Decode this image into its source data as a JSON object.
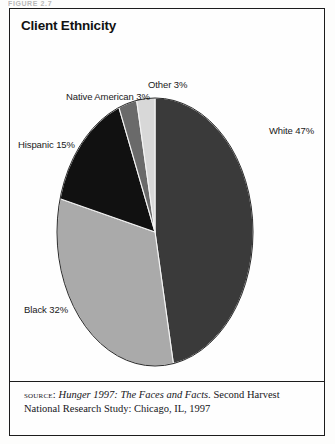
{
  "figure": {
    "cut_caption": "FIGURE 2.7",
    "title": "Client Ethnicity"
  },
  "source": {
    "label": "source:",
    "title": "Hunger 1997: The Faces and Facts.",
    "rest": "Second Harvest National Research Study: Chicago, IL, 1997"
  },
  "chart_data": {
    "type": "pie",
    "title": "Client Ethnicity",
    "unit": "%",
    "total": 100,
    "start_angle_deg": 0,
    "direction": "clockwise",
    "legend": "none-external-labels",
    "grid": false,
    "categories": [
      "White",
      "Black",
      "Hispanic",
      "Native American",
      "Other"
    ],
    "values": [
      47,
      32,
      15,
      3,
      3
    ],
    "colors": [
      "#3a3a3a",
      "#aaaaaa",
      "#111111",
      "#6a6a6a",
      "#d8d8d8"
    ],
    "labels": [
      "White 47%",
      "Black 32%",
      "Hispanic 15%",
      "Native American 3%",
      "Other 3%"
    ],
    "slices": [
      {
        "name": "White",
        "value": 47,
        "label": "White 47%",
        "color": "#3a3a3a"
      },
      {
        "name": "Black",
        "value": 32,
        "label": "Black 32%",
        "color": "#aaaaaa"
      },
      {
        "name": "Hispanic",
        "value": 15,
        "label": "Hispanic 15%",
        "color": "#111111"
      },
      {
        "name": "Native American",
        "value": 3,
        "label": "Native American 3%",
        "color": "#6a6a6a"
      },
      {
        "name": "Other",
        "value": 3,
        "label": "Other 3%",
        "color": "#d8d8d8"
      }
    ]
  }
}
